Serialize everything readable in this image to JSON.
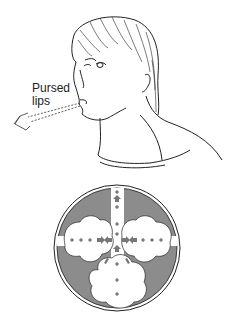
{
  "figure": {
    "label": {
      "line1": "Pursed",
      "line2": "lips"
    },
    "inset": {
      "description": "Cross-section of airway and alveoli with pressure markers",
      "colors": {
        "tissue": "#8c8c8c",
        "air": "#ffffff",
        "outline": "#222222",
        "arrow": "#777777"
      },
      "marker_symbol": "+"
    }
  }
}
